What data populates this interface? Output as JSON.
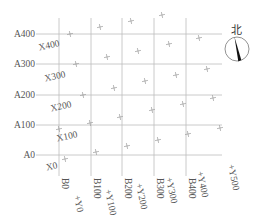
{
  "diagram": {
    "colors": {
      "grid_line": "#bdbdbd",
      "crosshair": "#9e9e9e",
      "label": "#555555",
      "compass_needle": "#111111"
    },
    "grid_a_rows": [
      {
        "label": "A400",
        "y": 34
      },
      {
        "label": "A300",
        "y": 64
      },
      {
        "label": "A200",
        "y": 95
      },
      {
        "label": "A100",
        "y": 125
      },
      {
        "label": "A0",
        "y": 155
      }
    ],
    "grid_b_cols": [
      {
        "label": "B0",
        "x": 59
      },
      {
        "label": "B100",
        "x": 91
      },
      {
        "label": "B200",
        "x": 122
      },
      {
        "label": "B300",
        "x": 154
      },
      {
        "label": "B400",
        "x": 186
      }
    ],
    "rotated_x_labels": [
      {
        "label": "X400",
        "x": 60,
        "y": 46
      },
      {
        "label": "X300",
        "x": 66,
        "y": 77
      },
      {
        "label": "X200",
        "x": 72,
        "y": 107
      },
      {
        "label": "X100",
        "x": 78,
        "y": 137
      },
      {
        "label": "X0",
        "x": 58,
        "y": 168
      }
    ],
    "rotated_y_labels": [
      {
        "label": "Y0",
        "x": 74,
        "y": 196
      },
      {
        "label": "Y100",
        "x": 105,
        "y": 190
      },
      {
        "label": "Y200",
        "x": 136,
        "y": 184
      },
      {
        "label": "Y300",
        "x": 166,
        "y": 178
      },
      {
        "label": "Y400",
        "x": 197,
        "y": 172
      },
      {
        "label": "Y500",
        "x": 228,
        "y": 165
      }
    ],
    "crosshairs": [
      {
        "x": 70,
        "y": 34
      },
      {
        "x": 100,
        "y": 27
      },
      {
        "x": 131,
        "y": 21
      },
      {
        "x": 162,
        "y": 15
      },
      {
        "x": 76,
        "y": 64
      },
      {
        "x": 107,
        "y": 57
      },
      {
        "x": 138,
        "y": 51
      },
      {
        "x": 169,
        "y": 44
      },
      {
        "x": 199,
        "y": 38
      },
      {
        "x": 83,
        "y": 95
      },
      {
        "x": 114,
        "y": 88
      },
      {
        "x": 145,
        "y": 81
      },
      {
        "x": 176,
        "y": 75
      },
      {
        "x": 207,
        "y": 69
      },
      {
        "x": 59,
        "y": 129
      },
      {
        "x": 90,
        "y": 123
      },
      {
        "x": 120,
        "y": 117
      },
      {
        "x": 152,
        "y": 110
      },
      {
        "x": 183,
        "y": 104
      },
      {
        "x": 213,
        "y": 98
      },
      {
        "x": 65,
        "y": 159
      },
      {
        "x": 96,
        "y": 152
      },
      {
        "x": 127,
        "y": 146
      },
      {
        "x": 158,
        "y": 140
      },
      {
        "x": 188,
        "y": 134
      },
      {
        "x": 220,
        "y": 128
      }
    ],
    "compass": {
      "label": "北",
      "cx": 237,
      "cy": 49,
      "r": 12
    }
  }
}
